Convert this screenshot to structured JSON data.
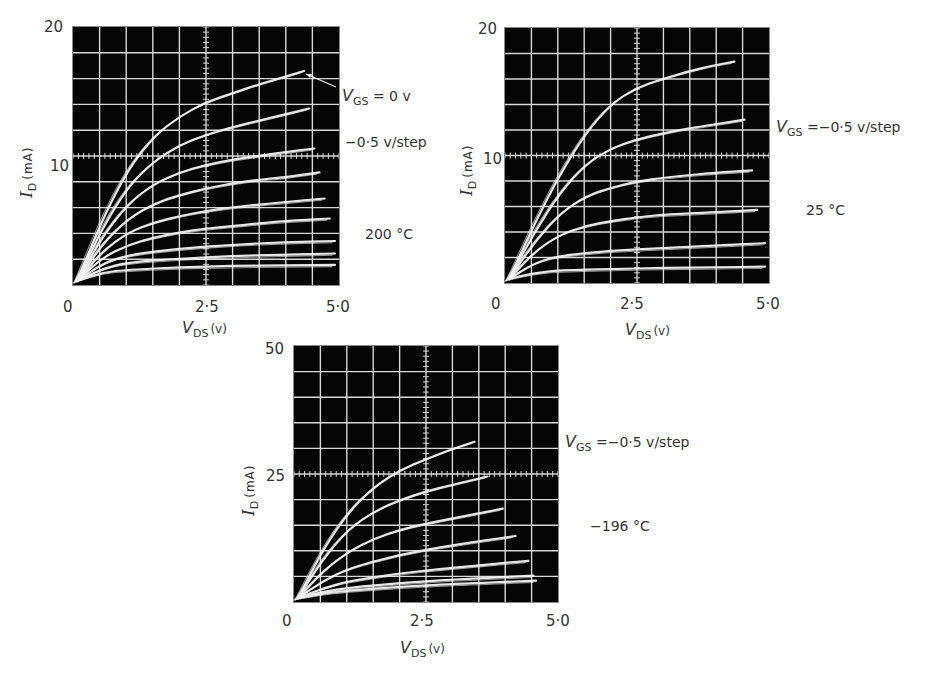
{
  "figure": {
    "panels": [
      {
        "id": "p200",
        "temperature_label": "200 °C",
        "vgs_label_prefix": "V",
        "vgs_label_sub": "GS",
        "vgs_label_text": " = 0 v",
        "step_label": "−0·5 v/step",
        "y_ticks": [
          "20",
          "10",
          ""
        ],
        "x_ticks": [
          "0",
          "2·5",
          "5·0"
        ],
        "ylabel_sym": "I",
        "ylabel_sub": "D",
        "ylabel_unit": "(mA)",
        "xlabel_sym": "V",
        "xlabel_sub": "DS",
        "xlabel_unit": "(v)"
      },
      {
        "id": "p25",
        "temperature_label": "25 °C",
        "vgs_label_prefix": "V",
        "vgs_label_sub": "GS",
        "vgs_label_text": " =−0·5 v/step",
        "y_ticks": [
          "20",
          "10",
          ""
        ],
        "x_ticks": [
          "0",
          "2·5",
          "5·0"
        ],
        "ylabel_sym": "I",
        "ylabel_sub": "D",
        "ylabel_unit": "(mA)",
        "xlabel_sym": "V",
        "xlabel_sub": "DS",
        "xlabel_unit": "(v)"
      },
      {
        "id": "pm196",
        "temperature_label": "−196 °C",
        "vgs_label_prefix": "V",
        "vgs_label_sub": "GS",
        "vgs_label_text": " =−0·5 v/step",
        "y_ticks": [
          "50",
          "25",
          ""
        ],
        "x_ticks": [
          "0",
          "2·5",
          "5·0"
        ],
        "ylabel_sym": "I",
        "ylabel_sub": "D",
        "ylabel_unit": "(mA)",
        "xlabel_sym": "V",
        "xlabel_sub": "DS",
        "xlabel_unit": "(v)"
      }
    ]
  },
  "colors": {
    "screen": "#050505",
    "grid": "#d8d8d8",
    "trace": "#f2f2f2",
    "text": "#333333"
  },
  "chart_data": [
    {
      "type": "line",
      "title": "200 °C",
      "xlabel": "V_DS (v)",
      "ylabel": "I_D (mA)",
      "xlim": [
        0,
        5.0
      ],
      "ylim": [
        0,
        20
      ],
      "x_ticks": [
        0,
        2.5,
        5.0
      ],
      "y_ticks": [
        10,
        20
      ],
      "grid": true,
      "grid_divisions": [
        10,
        10
      ],
      "annotations": [
        "V_GS = 0 v (arrow to top curve)",
        "−0·5 v/step",
        "200 °C"
      ],
      "series": [
        {
          "name": "VGS=0 V",
          "x": [
            0,
            0.5,
            1.0,
            1.5,
            2.0,
            2.5,
            3.0,
            3.5,
            4.0,
            4.4
          ],
          "values": [
            0,
            5.0,
            9.0,
            11.6,
            13.2,
            14.3,
            15.0,
            15.7,
            16.3,
            16.8
          ]
        },
        {
          "name": "VGS=-0.5 V",
          "x": [
            0,
            0.5,
            1.0,
            1.5,
            2.0,
            2.5,
            3.0,
            3.5,
            4.0,
            4.5
          ],
          "values": [
            0,
            4.3,
            7.6,
            9.6,
            10.9,
            11.7,
            12.3,
            12.8,
            13.3,
            13.8
          ]
        },
        {
          "name": "VGS=-1.0 V",
          "x": [
            0,
            0.5,
            1.0,
            1.5,
            2.0,
            2.5,
            3.0,
            3.5,
            4.0,
            4.6
          ],
          "values": [
            0,
            3.6,
            6.2,
            7.8,
            8.7,
            9.3,
            9.7,
            10.0,
            10.3,
            10.6
          ]
        },
        {
          "name": "VGS=-1.5 V",
          "x": [
            0,
            0.5,
            1.0,
            1.5,
            2.0,
            2.5,
            3.0,
            3.5,
            4.0,
            4.7
          ],
          "values": [
            0,
            3.0,
            5.0,
            6.2,
            6.9,
            7.4,
            7.8,
            8.1,
            8.3,
            8.7
          ]
        },
        {
          "name": "VGS=-2.0 V",
          "x": [
            0,
            0.5,
            1.0,
            1.5,
            2.0,
            2.5,
            3.0,
            3.5,
            4.0,
            4.8
          ],
          "values": [
            0,
            2.4,
            3.9,
            4.7,
            5.2,
            5.6,
            5.9,
            6.1,
            6.3,
            6.6
          ]
        },
        {
          "name": "VGS=-2.5 V",
          "x": [
            0,
            0.5,
            1.0,
            1.5,
            2.0,
            2.5,
            3.0,
            3.5,
            4.0,
            4.9
          ],
          "values": [
            0,
            1.9,
            2.9,
            3.5,
            3.9,
            4.2,
            4.4,
            4.6,
            4.8,
            5.0
          ]
        },
        {
          "name": "VGS=-3.0 V",
          "x": [
            0,
            0.5,
            1.0,
            2.0,
            3.0,
            4.0,
            5.0
          ],
          "values": [
            0,
            1.4,
            2.1,
            2.6,
            2.9,
            3.1,
            3.2
          ]
        },
        {
          "name": "VGS=-3.5 V",
          "x": [
            0,
            0.5,
            1.0,
            2.0,
            3.0,
            4.0,
            5.0
          ],
          "values": [
            0,
            1.0,
            1.5,
            1.8,
            2.0,
            2.1,
            2.2
          ]
        },
        {
          "name": "VGS=-4.0 V",
          "x": [
            0,
            0.5,
            1.0,
            2.0,
            3.0,
            4.0,
            5.0
          ],
          "values": [
            0,
            0.7,
            0.9,
            1.1,
            1.2,
            1.25,
            1.3
          ]
        }
      ]
    },
    {
      "type": "line",
      "title": "25 °C",
      "xlabel": "V_DS (v)",
      "ylabel": "I_D (mA)",
      "xlim": [
        0,
        5.0
      ],
      "ylim": [
        0,
        20
      ],
      "x_ticks": [
        0,
        2.5,
        5.0
      ],
      "y_ticks": [
        10,
        20
      ],
      "grid": true,
      "grid_divisions": [
        10,
        10
      ],
      "annotations": [
        "V_GS = −0·5 v/step",
        "25 °C"
      ],
      "series": [
        {
          "name": "VGS=0 V",
          "x": [
            0,
            0.5,
            1.0,
            1.5,
            2.0,
            2.5,
            3.0,
            3.5,
            4.0,
            4.4
          ],
          "values": [
            0,
            4.5,
            8.5,
            11.8,
            14.2,
            15.5,
            16.2,
            16.8,
            17.3,
            17.6
          ]
        },
        {
          "name": "VGS=-0.5 V",
          "x": [
            0,
            0.5,
            1.0,
            1.5,
            2.0,
            2.5,
            3.0,
            3.5,
            4.0,
            4.6
          ],
          "values": [
            0,
            3.8,
            7.0,
            9.3,
            10.6,
            11.3,
            11.8,
            12.2,
            12.5,
            12.9
          ]
        },
        {
          "name": "VGS=-1.0 V",
          "x": [
            0,
            0.5,
            1.0,
            1.5,
            2.0,
            2.5,
            3.0,
            3.5,
            4.0,
            4.75
          ],
          "values": [
            0,
            3.0,
            5.3,
            6.7,
            7.4,
            7.9,
            8.2,
            8.4,
            8.6,
            8.8
          ]
        },
        {
          "name": "VGS=-1.5 V",
          "x": [
            0,
            0.5,
            1.0,
            1.5,
            2.0,
            2.5,
            3.0,
            3.5,
            4.0,
            4.85
          ],
          "values": [
            0,
            2.2,
            3.6,
            4.3,
            4.7,
            5.0,
            5.2,
            5.3,
            5.4,
            5.6
          ]
        },
        {
          "name": "VGS=-2.0 V",
          "x": [
            0,
            0.5,
            1.0,
            2.0,
            3.0,
            4.0,
            5.0
          ],
          "values": [
            0,
            1.3,
            1.9,
            2.3,
            2.5,
            2.7,
            2.9
          ]
        },
        {
          "name": "VGS=-2.5 V",
          "x": [
            0,
            0.5,
            1.0,
            2.0,
            3.0,
            4.0,
            5.0
          ],
          "values": [
            0,
            0.5,
            0.7,
            0.8,
            0.9,
            0.95,
            1.0
          ]
        }
      ]
    },
    {
      "type": "line",
      "title": "−196 °C",
      "xlabel": "V_DS (v)",
      "ylabel": "I_D (mA)",
      "xlim": [
        0,
        5.0
      ],
      "ylim": [
        0,
        50
      ],
      "x_ticks": [
        0,
        2.5,
        5.0
      ],
      "y_ticks": [
        25,
        50
      ],
      "grid": true,
      "grid_divisions": [
        10,
        10
      ],
      "annotations": [
        "V_GS = −0·5 v/step",
        "−196 °C"
      ],
      "series": [
        {
          "name": "VGS=0 V",
          "x": [
            0,
            0.5,
            1.0,
            1.5,
            2.0,
            2.5,
            3.0,
            3.45
          ],
          "values": [
            0,
            10.0,
            17.5,
            22.5,
            25.8,
            28.0,
            30.0,
            31.5
          ]
        },
        {
          "name": "VGS=-0.5 V",
          "x": [
            0,
            0.5,
            1.0,
            1.5,
            2.0,
            2.5,
            3.0,
            3.7
          ],
          "values": [
            0,
            8.0,
            14.0,
            17.5,
            19.8,
            21.5,
            22.8,
            24.5
          ]
        },
        {
          "name": "VGS=-1.0 V",
          "x": [
            0,
            0.5,
            1.0,
            1.5,
            2.0,
            2.5,
            3.0,
            4.0
          ],
          "values": [
            0,
            5.5,
            9.5,
            12.0,
            13.8,
            15.0,
            16.0,
            18.0
          ]
        },
        {
          "name": "VGS=-1.5 V",
          "x": [
            0,
            0.5,
            1.0,
            2.0,
            3.0,
            4.25
          ],
          "values": [
            0,
            3.5,
            6.0,
            8.8,
            10.6,
            12.5
          ]
        },
        {
          "name": "VGS=-2.0 V",
          "x": [
            0,
            0.5,
            1.0,
            2.0,
            3.0,
            4.5
          ],
          "values": [
            0,
            2.0,
            3.4,
            5.0,
            6.1,
            7.5
          ]
        },
        {
          "name": "VGS=-2.5 V",
          "x": [
            0,
            0.5,
            1.0,
            2.0,
            3.0,
            4.6
          ],
          "values": [
            0,
            1.3,
            2.1,
            3.0,
            3.7,
            4.5
          ]
        },
        {
          "name": "VGS=-3.0 V",
          "x": [
            0,
            0.5,
            1.0,
            2.0,
            3.0,
            4.65
          ],
          "values": [
            0,
            0.9,
            1.5,
            2.3,
            2.8,
            3.5
          ]
        }
      ]
    }
  ]
}
